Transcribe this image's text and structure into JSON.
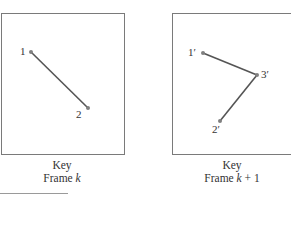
{
  "diagram": {
    "frames": [
      {
        "id": "frame-k",
        "caption_line1": "Key",
        "caption_line2_prefix": "Frame ",
        "caption_line2_var": "k",
        "caption_line2_suffix": "",
        "points": [
          {
            "label": "1",
            "x": 31,
            "y": 52
          },
          {
            "label": "2",
            "x": 88,
            "y": 108
          }
        ],
        "edges": [
          [
            "1",
            "2"
          ]
        ]
      },
      {
        "id": "frame-k-plus-1",
        "caption_line1": "Key",
        "caption_line2_prefix": "Frame ",
        "caption_line2_var": "k",
        "caption_line2_suffix": " + 1",
        "points": [
          {
            "label": "1′",
            "x": 203,
            "y": 53
          },
          {
            "label": "3′",
            "x": 257,
            "y": 75
          },
          {
            "label": "2′",
            "x": 220,
            "y": 121
          }
        ],
        "edges": [
          [
            "1′",
            "3′"
          ],
          [
            "3′",
            "2′"
          ]
        ]
      }
    ],
    "colors": {
      "line": "#555555",
      "point": "#808080",
      "border": "#7a7a7a"
    }
  }
}
